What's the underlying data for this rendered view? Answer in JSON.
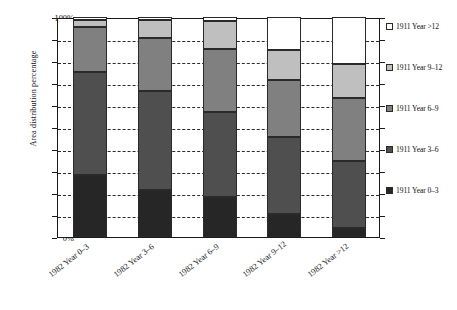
{
  "chart_data": {
    "type": "bar",
    "subtype": "stacked-bar-100-percent",
    "title": "",
    "xlabel": "",
    "ylabel": "Area distribution percentage",
    "ylim": [
      0,
      100
    ],
    "yunit": "%",
    "grid": true,
    "legend_position": "right",
    "categories": [
      "1982 Year 0–3",
      "1982 Year 3–6",
      "1982 Year 6–9",
      "1982 Year 9–12",
      "1982 Year >12"
    ],
    "ytick_labels": [
      "0%",
      "10%",
      "20%",
      "30%",
      "40%",
      "50%",
      "60%",
      "70%",
      "80%",
      "90%",
      "100%"
    ],
    "ytick_values": [
      0,
      10,
      20,
      30,
      40,
      50,
      60,
      70,
      80,
      90,
      100
    ],
    "series": [
      {
        "name": "1911 Year 0–3",
        "color": "#262626",
        "values": [
          28.0,
          21.5,
          18.0,
          10.5,
          4.0
        ]
      },
      {
        "name": "1911 Year 3–6",
        "color": "#4f4f4f",
        "values": [
          47.0,
          45.0,
          39.0,
          35.0,
          30.5
        ]
      },
      {
        "name": "1911 Year 6–9",
        "color": "#808080",
        "values": [
          20.5,
          24.0,
          28.5,
          26.0,
          28.5
        ]
      },
      {
        "name": "1911 Year 9–12",
        "color": "#bfbfbf",
        "values": [
          3.0,
          8.0,
          12.5,
          13.5,
          15.5
        ]
      },
      {
        "name": "1911 Year >12",
        "color": "#ffffff",
        "values": [
          1.5,
          1.5,
          2.0,
          15.0,
          21.5
        ]
      }
    ],
    "cumulative_tops": [
      [
        28.0,
        75.0,
        95.5,
        98.5,
        100.0
      ],
      [
        21.5,
        66.5,
        90.5,
        98.5,
        100.0
      ],
      [
        18.0,
        57.0,
        85.5,
        98.0,
        100.0
      ],
      [
        10.5,
        45.5,
        71.5,
        85.0,
        100.0
      ],
      [
        4.0,
        34.5,
        63.0,
        78.5,
        100.0
      ]
    ]
  },
  "legend": {
    "entries": [
      {
        "label": "1911 Year >12",
        "color": "#ffffff"
      },
      {
        "label": "1911 Year 9–12",
        "color": "#bfbfbf"
      },
      {
        "label": "1911 Year 6–9",
        "color": "#808080"
      },
      {
        "label": "1911 Year 3–6",
        "color": "#4f4f4f"
      },
      {
        "label": "1911 Year 0–3",
        "color": "#262626"
      }
    ]
  },
  "colors": {
    "axis": "#1a1a1a",
    "grid": "#2b2b2b",
    "background": "#ffffff",
    "text": "#111111"
  }
}
